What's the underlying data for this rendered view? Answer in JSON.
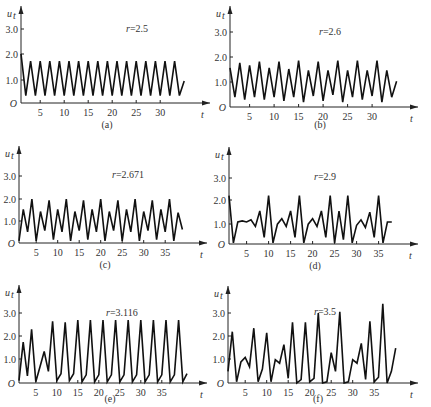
{
  "figure": {
    "y_symbol": "u",
    "y_subscript": "t",
    "x_symbol": "t",
    "origin_label": "O",
    "y_ticks": [
      "1.0",
      "2.0",
      "3.0"
    ]
  },
  "chart_data": [
    {
      "type": "line",
      "caption": "(a)",
      "annotation": "r=2.5",
      "xlabel": "t",
      "ylabel": "u_t",
      "x_ticks": [
        5,
        10,
        15,
        20,
        25,
        30
      ],
      "y_ticks": [
        1.0,
        2.0,
        3.0
      ],
      "xlim": [
        0,
        40
      ],
      "ylim": [
        0,
        3.5
      ],
      "x": [
        1,
        2,
        3,
        4,
        5,
        6,
        7,
        8,
        9,
        10,
        11,
        12,
        13,
        14,
        15,
        16,
        17,
        18,
        19,
        20,
        21,
        22,
        23,
        24,
        25,
        26,
        27,
        28,
        29,
        30,
        31,
        32,
        33,
        34,
        35
      ],
      "values": [
        2.0,
        0.3,
        1.7,
        0.3,
        1.7,
        0.3,
        1.7,
        0.3,
        1.7,
        0.3,
        1.7,
        0.3,
        1.7,
        0.3,
        1.7,
        0.3,
        1.7,
        0.3,
        1.7,
        0.3,
        1.7,
        0.3,
        1.7,
        0.3,
        1.7,
        0.3,
        1.7,
        0.3,
        1.7,
        0.3,
        1.7,
        0.3,
        1.7,
        0.3,
        0.9
      ]
    },
    {
      "type": "line",
      "caption": "(b)",
      "annotation": "r=2.6",
      "xlabel": "t",
      "ylabel": "u_t",
      "x_ticks": [
        5,
        10,
        15,
        20,
        25,
        30
      ],
      "y_ticks": [
        1.0,
        2.0,
        3.0
      ],
      "xlim": [
        0,
        40
      ],
      "ylim": [
        0,
        3.5
      ],
      "x": [
        1,
        2,
        3,
        4,
        5,
        6,
        7,
        8,
        9,
        10,
        11,
        12,
        13,
        14,
        15,
        16,
        17,
        18,
        19,
        20,
        21,
        22,
        23,
        24,
        25,
        26,
        27,
        28,
        29,
        30,
        31,
        32,
        33,
        34,
        35
      ],
      "values": [
        1.6,
        0.4,
        1.8,
        0.3,
        1.7,
        0.4,
        1.85,
        0.3,
        1.6,
        0.4,
        1.85,
        0.25,
        1.55,
        0.4,
        1.9,
        0.2,
        1.5,
        0.45,
        1.85,
        0.25,
        1.5,
        0.5,
        1.9,
        0.2,
        1.5,
        0.4,
        1.9,
        0.3,
        1.5,
        0.45,
        1.9,
        0.2,
        1.5,
        0.4,
        1.05
      ]
    },
    {
      "type": "line",
      "caption": "(c)",
      "annotation": "r=2.671",
      "xlabel": "t",
      "ylabel": "u_t",
      "x_ticks": [
        5,
        10,
        15,
        20,
        25,
        30,
        35
      ],
      "y_ticks": [
        1.0,
        2.0,
        3.0
      ],
      "xlim": [
        0,
        42
      ],
      "ylim": [
        0,
        3.5
      ],
      "x": [
        1,
        2,
        3,
        4,
        5,
        6,
        7,
        8,
        9,
        10,
        11,
        12,
        13,
        14,
        15,
        16,
        17,
        18,
        19,
        20,
        21,
        22,
        23,
        24,
        25,
        26,
        27,
        28,
        29,
        30,
        31,
        32,
        33,
        34,
        35,
        36,
        37,
        38,
        39
      ],
      "values": [
        0.1,
        1.5,
        0.5,
        1.95,
        0.1,
        1.4,
        0.55,
        1.9,
        0.15,
        1.5,
        0.5,
        1.95,
        0.1,
        1.4,
        0.55,
        1.9,
        0.15,
        1.5,
        0.5,
        1.95,
        0.1,
        1.4,
        0.55,
        1.9,
        0.1,
        1.5,
        0.5,
        1.95,
        0.1,
        1.4,
        0.55,
        1.9,
        0.15,
        1.5,
        0.5,
        1.95,
        0.1,
        1.35,
        0.6
      ]
    },
    {
      "type": "line",
      "caption": "(d)",
      "annotation": "r=2.9",
      "xlabel": "t",
      "ylabel": "u_t",
      "x_ticks": [
        5,
        10,
        15,
        20,
        25,
        30,
        35
      ],
      "y_ticks": [
        1.0,
        2.0,
        3.0
      ],
      "xlim": [
        0,
        42
      ],
      "ylim": [
        0,
        3.5
      ],
      "x": [
        1,
        2,
        3,
        4,
        5,
        6,
        7,
        8,
        9,
        10,
        11,
        12,
        13,
        14,
        15,
        16,
        17,
        18,
        19,
        20,
        21,
        22,
        23,
        24,
        25,
        26,
        27,
        28,
        29,
        30,
        31,
        32,
        33,
        34,
        35,
        36,
        37,
        38
      ],
      "values": [
        2.2,
        0.05,
        1.0,
        1.05,
        1.0,
        1.1,
        0.8,
        1.5,
        0.3,
        2.2,
        0.05,
        0.9,
        1.15,
        0.8,
        1.5,
        0.3,
        2.2,
        0.05,
        0.9,
        1.15,
        0.8,
        1.5,
        0.3,
        2.2,
        0.05,
        1.5,
        0.2,
        2.2,
        0.05,
        0.85,
        1.1,
        0.75,
        1.45,
        0.3,
        2.2,
        0.05,
        1.0,
        1.0
      ]
    },
    {
      "type": "line",
      "caption": "(e)",
      "annotation": "r=3.116",
      "xlabel": "t",
      "ylabel": "u_t",
      "x_ticks": [
        5,
        10,
        15,
        20,
        25,
        30,
        35
      ],
      "y_ticks": [
        1.0,
        2.0,
        3.0
      ],
      "xlim": [
        0,
        42
      ],
      "ylim": [
        0,
        3.5
      ],
      "x": [
        1,
        2,
        3,
        4,
        5,
        6,
        7,
        8,
        9,
        10,
        11,
        12,
        13,
        14,
        15,
        16,
        17,
        18,
        19,
        20,
        21,
        22,
        23,
        24,
        25,
        26,
        27,
        28,
        29,
        30,
        31,
        32,
        33,
        34,
        35,
        36,
        37,
        38,
        39,
        40,
        41
      ],
      "values": [
        0.1,
        1.75,
        0.3,
        2.3,
        0.05,
        0.7,
        1.35,
        0.5,
        2.65,
        0.1,
        0.4,
        2.6,
        0.1,
        0.4,
        2.7,
        0.05,
        0.35,
        2.7,
        0.05,
        0.35,
        2.7,
        0.05,
        0.35,
        2.7,
        0.05,
        0.35,
        2.7,
        0.05,
        0.35,
        2.7,
        0.05,
        0.35,
        2.7,
        0.05,
        0.35,
        2.7,
        0.05,
        0.35,
        2.7,
        0.05,
        0.4
      ]
    },
    {
      "type": "line",
      "caption": "(f)",
      "annotation": "r=3.5",
      "xlabel": "t",
      "ylabel": "u_t",
      "x_ticks": [
        5,
        10,
        15,
        20,
        25,
        30,
        35
      ],
      "y_ticks": [
        1.0,
        2.0,
        3.0
      ],
      "xlim": [
        0,
        42
      ],
      "ylim": [
        0,
        3.5
      ],
      "x": [
        1,
        2,
        3,
        4,
        5,
        6,
        7,
        8,
        9,
        10,
        11,
        12,
        13,
        14,
        15,
        16,
        17,
        18,
        19,
        20,
        21,
        22,
        23,
        24,
        25,
        26,
        27,
        28,
        29,
        30,
        31,
        32,
        33,
        34,
        35,
        36,
        37,
        38,
        39,
        40
      ],
      "values": [
        0.5,
        2.2,
        0.05,
        0.9,
        1.1,
        0.7,
        2.35,
        0.05,
        0.6,
        2.15,
        0.05,
        1.0,
        0.85,
        1.65,
        0.2,
        2.6,
        0.0,
        0.15,
        2.6,
        0.05,
        0.2,
        3.0,
        0.0,
        0.05,
        1.3,
        0.5,
        3.05,
        0.0,
        0.05,
        1.0,
        0.85,
        1.7,
        0.15,
        2.65,
        0.05,
        0.25,
        3.4,
        0.0,
        0.5,
        1.5
      ]
    }
  ]
}
